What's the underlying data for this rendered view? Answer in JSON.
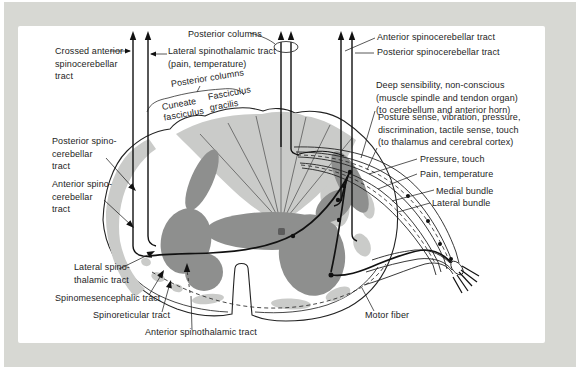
{
  "colors": {
    "frame_background": "#d7d8d3",
    "panel_background": "#ffffff",
    "light_gray_regions": "#cacbc9",
    "gray_matter": "#8e8f8e",
    "line_ink": "#1d1d1d"
  },
  "labels": {
    "posterior_columns_top": {
      "text": "Posterior columns"
    },
    "crossed_anterior_spinocerebellar_tract": {
      "text": "Crossed anterior\nspinocerebellar\ntract"
    },
    "lateral_spinothalamic_tract_top": {
      "text": "Lateral spinothalamic tract\n(pain, temperature)"
    },
    "anterior_spinocerebellar_tract_top": {
      "text": "Anterior spinocerebellar tract"
    },
    "posterior_spinocerebellar_tract_top": {
      "text": "Posterior spinocerebellar tract"
    },
    "posterior_columns_curved": {
      "text": "Posterior columns"
    },
    "cuneate_fasciculus": {
      "text": "Cuneate\nfasciculus"
    },
    "fasciculus_gracilis": {
      "text": "Fasciculus\ngracilis"
    },
    "deep_sensibility": {
      "text": "Deep sensibility, non-conscious\n(muscle spindle and tendon organ)\n(to cerebellum and anterior horn)"
    },
    "posture_sense": {
      "text": "Posture sense, vibration, pressure,\ndiscrimination, tactile sense, touch\n(to thalamus and cerebral cortex)"
    },
    "pressure_touch": {
      "text": "Pressure, touch"
    },
    "pain_temperature": {
      "text": "Pain, temperature"
    },
    "medial_bundle": {
      "text": "Medial bundle"
    },
    "lateral_bundle": {
      "text": "Lateral bundle"
    },
    "posterior_spinocerebellar_tract_left": {
      "text": "Posterior spino-\ncerebellar\ntract"
    },
    "anterior_spinocerebellar_tract_left": {
      "text": "Anterior spino-\ncerebellar\ntract"
    },
    "lateral_spinothalamic_tract_left": {
      "text": "Lateral spino-\nthalamic tract"
    },
    "spinomesencephalic_tract": {
      "text": "Spinomesencephalic tract"
    },
    "spinoreticular_tract": {
      "text": "Spinoreticular tract"
    },
    "anterior_spinothalamic_tract": {
      "text": "Anterior spinothalamic tract"
    },
    "motor_fiber": {
      "text": "Motor fiber"
    }
  }
}
